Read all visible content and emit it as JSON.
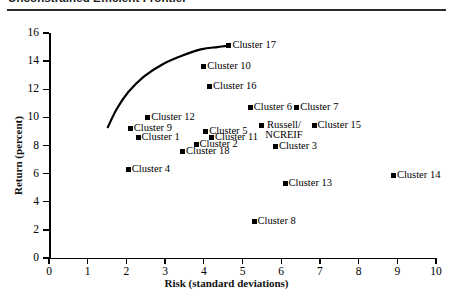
{
  "title": "Unconstrained Efficient Frontier",
  "chart_data": {
    "type": "scatter",
    "title": "Unconstrained Efficient Frontier",
    "xlabel": "Risk (standard deviations)",
    "ylabel": "Return (percent)",
    "xlim": [
      0,
      10
    ],
    "ylim": [
      0,
      16
    ],
    "xticks": [
      "0",
      "1",
      "2",
      "3",
      "4",
      "5",
      "6",
      "7",
      "8",
      "9",
      "10"
    ],
    "yticks": [
      "0",
      "2",
      "4",
      "6",
      "8",
      "10",
      "12",
      "14",
      "16"
    ],
    "grid": false,
    "legend": false,
    "points": [
      {
        "label": "Cluster 17",
        "x": 4.65,
        "y": 15.1
      },
      {
        "label": "Cluster 10",
        "x": 4.0,
        "y": 13.6
      },
      {
        "label": "Cluster 16",
        "x": 4.15,
        "y": 12.2
      },
      {
        "label": "Cluster 6",
        "x": 5.2,
        "y": 10.7
      },
      {
        "label": "Cluster 7",
        "x": 6.4,
        "y": 10.7
      },
      {
        "label": "Cluster 12",
        "x": 2.55,
        "y": 10.0
      },
      {
        "label": "Russell/ NCREIF",
        "x": 5.5,
        "y": 9.4,
        "two_line": true
      },
      {
        "label": "Cluster 15",
        "x": 6.85,
        "y": 9.4
      },
      {
        "label": "Cluster 5",
        "x": 4.05,
        "y": 9.0
      },
      {
        "label": "Cluster 9",
        "x": 2.1,
        "y": 9.2
      },
      {
        "label": "Cluster 11",
        "x": 4.2,
        "y": 8.6
      },
      {
        "label": "Cluster 1",
        "x": 2.3,
        "y": 8.6
      },
      {
        "label": "Cluster 2",
        "x": 3.8,
        "y": 8.1
      },
      {
        "label": "Cluster 3",
        "x": 5.85,
        "y": 7.9
      },
      {
        "label": "Cluster 18",
        "x": 3.45,
        "y": 7.6
      },
      {
        "label": "Cluster 4",
        "x": 2.05,
        "y": 6.3
      },
      {
        "label": "Cluster 13",
        "x": 6.1,
        "y": 5.3
      },
      {
        "label": "Cluster 14",
        "x": 8.9,
        "y": 5.9
      },
      {
        "label": "Cluster 8",
        "x": 5.3,
        "y": 2.6
      }
    ],
    "frontier_curve": {
      "name": "efficient frontier",
      "x": [
        1.52,
        1.75,
        2.05,
        2.45,
        2.95,
        3.45,
        3.95,
        4.35,
        4.65
      ],
      "y": [
        9.3,
        10.6,
        11.8,
        12.9,
        13.8,
        14.4,
        14.85,
        15.0,
        15.1
      ]
    }
  }
}
